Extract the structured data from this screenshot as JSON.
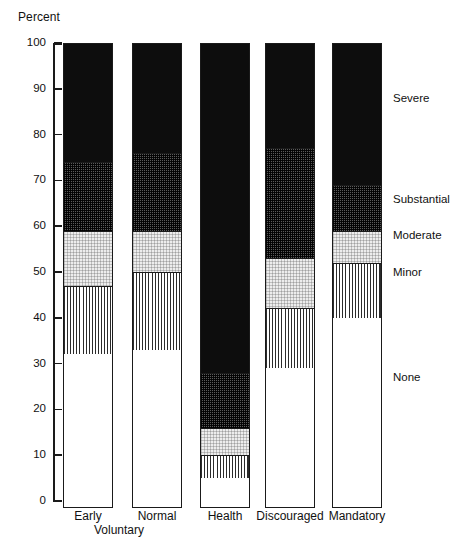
{
  "chart_data": {
    "type": "bar",
    "title": "",
    "subtitle": "",
    "stacked": true,
    "orientation": "vertical",
    "xlabel": "",
    "ylabel": "Percent",
    "ylim": [
      0,
      100
    ],
    "yticks": [
      0,
      10,
      20,
      30,
      40,
      50,
      60,
      70,
      80,
      90,
      100
    ],
    "ytick_labels": [
      "0",
      "10",
      "20",
      "30",
      "40",
      "50",
      "60",
      "70",
      "80",
      "90",
      "100"
    ],
    "grid": false,
    "legend_position": "right",
    "categories": [
      "Early",
      "Normal",
      "Health",
      "Discouraged",
      "Mandatory"
    ],
    "group_label": "Voluntary",
    "group_label_spans": [
      "Early",
      "Normal"
    ],
    "series": [
      {
        "name": "None",
        "values": [
          32,
          33,
          5,
          29,
          40
        ],
        "fill": "white"
      },
      {
        "name": "Minor",
        "values": [
          15,
          17,
          5,
          13,
          12
        ],
        "fill": "vertical-line-hatch"
      },
      {
        "name": "Moderate",
        "values": [
          12,
          9,
          6,
          11,
          7
        ],
        "fill": "light-stipple"
      },
      {
        "name": "Substantial",
        "values": [
          15,
          17,
          12,
          24,
          10
        ],
        "fill": "dark-checker"
      },
      {
        "name": "Severe",
        "values": [
          26,
          24,
          72,
          23,
          31
        ],
        "fill": "solid-black"
      }
    ],
    "cumulative_tops": {
      "Early": {
        "None": 32,
        "Minor": 47,
        "Moderate": 59,
        "Substantial": 74,
        "Severe": 100
      },
      "Normal": {
        "None": 33,
        "Minor": 50,
        "Moderate": 59,
        "Substantial": 76,
        "Severe": 100
      },
      "Health": {
        "None": 5,
        "Minor": 10,
        "Moderate": 16,
        "Substantial": 28,
        "Severe": 100
      },
      "Discouraged": {
        "None": 29,
        "Minor": 42,
        "Moderate": 53,
        "Substantial": 77,
        "Severe": 100
      },
      "Mandatory": {
        "None": 40,
        "Minor": 52,
        "Moderate": 59,
        "Substantial": 69,
        "Severe": 100
      }
    },
    "legend_entries": [
      {
        "label": "Severe",
        "value_y": 88
      },
      {
        "label": "Substantial",
        "value_y": 66
      },
      {
        "label": "Moderate",
        "value_y": 58
      },
      {
        "label": "Minor",
        "value_y": 50
      },
      {
        "label": "None",
        "value_y": 27
      }
    ],
    "colors": {
      "severe": "#0d0d0d",
      "substantial": "#5a5a5a",
      "moderate": "#ededed",
      "minor": "#ffffff",
      "none": "#ffffff",
      "axis": "#1a1a1a",
      "background": "#ffffff"
    }
  }
}
